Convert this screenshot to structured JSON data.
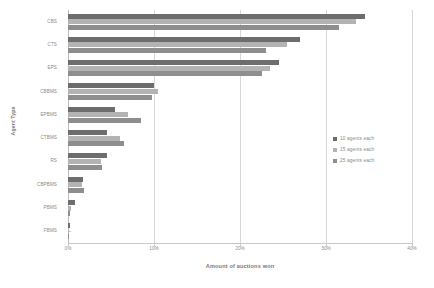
{
  "chart_data": {
    "type": "bar",
    "orientation": "horizontal",
    "title": "",
    "xlabel": "Amount of auctions won",
    "ylabel": "Agent Type",
    "categories": [
      "CBS",
      "CTS",
      "EPS",
      "CBBMS",
      "EPBMS",
      "CTBMS",
      "RS",
      "CBPBMS",
      "PBMS",
      "FBMS"
    ],
    "series": [
      {
        "name": "10 agents each",
        "color": "#6d6d6d",
        "values": [
          34.5,
          27.0,
          24.5,
          10.0,
          5.5,
          4.5,
          4.5,
          1.8,
          0.8,
          0.2
        ]
      },
      {
        "name": "15 agents each",
        "color": "#b3b3b3",
        "values": [
          33.5,
          25.5,
          23.5,
          10.5,
          7.0,
          6.0,
          3.8,
          1.6,
          0.4,
          0.1
        ]
      },
      {
        "name": "25 agents each",
        "color": "#8e8e8e",
        "values": [
          31.5,
          23.0,
          22.5,
          9.8,
          8.5,
          6.5,
          4.0,
          1.9,
          0.2,
          0.1
        ]
      }
    ],
    "xlim": [
      0,
      40
    ],
    "xticks": [
      0,
      10,
      20,
      30,
      40
    ],
    "xtick_labels": [
      "0%",
      "10%",
      "20%",
      "30%",
      "40%"
    ],
    "grid": "vertical",
    "legend_position": "right-middle"
  }
}
